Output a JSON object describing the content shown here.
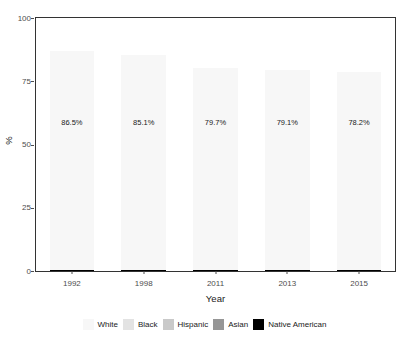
{
  "chart_data": {
    "type": "bar",
    "subtype": "stacked-percent",
    "title": "",
    "xlabel": "Year",
    "ylabel": "%",
    "categories": [
      "1992",
      "1998",
      "2011",
      "2013",
      "2015"
    ],
    "ylim": [
      0,
      100
    ],
    "yticks": [
      0,
      25,
      50,
      75,
      100
    ],
    "ytick_labels": [
      "0",
      "25",
      "50",
      "75",
      "100"
    ],
    "grid": false,
    "legend_position": "bottom",
    "stack_order_bottom_to_top": [
      "Asian",
      "Hispanic",
      "Black",
      "White"
    ],
    "series": [
      {
        "name": "White",
        "color": "#f7f7f7",
        "values": [
          86.5,
          85.1,
          79.7,
          79.1,
          78.2
        ],
        "labels": [
          "86.5%",
          "85.1%",
          "79.7%",
          "79.1%",
          "78.2%"
        ]
      },
      {
        "name": "Black",
        "color": "#e3e3e3",
        "values": [
          4.0,
          4.3,
          6.4,
          6.2,
          6.6
        ]
      },
      {
        "name": "Hispanic",
        "color": "#c9c9c9",
        "values": [
          2.6,
          3.0,
          3.8,
          4.1,
          4.4
        ]
      },
      {
        "name": "Asian",
        "color": "#969696",
        "values": [
          6.7,
          7.4,
          9.9,
          10.4,
          10.6
        ]
      },
      {
        "name": "Native American",
        "color": "#000000",
        "values": [
          0.2,
          0.2,
          0.2,
          0.2,
          0.2
        ]
      }
    ],
    "annotations": [
      {
        "category": "1992",
        "text": "86.5%",
        "y": 59
      },
      {
        "category": "1998",
        "text": "85.1%",
        "y": 59
      },
      {
        "category": "2011",
        "text": "79.7%",
        "y": 59
      },
      {
        "category": "2013",
        "text": "79.1%",
        "y": 59
      },
      {
        "category": "2015",
        "text": "78.2%",
        "y": 59
      }
    ]
  },
  "legend": {
    "items": [
      {
        "label": "White",
        "color": "#f7f7f7"
      },
      {
        "label": "Black",
        "color": "#e3e3e3"
      },
      {
        "label": "Hispanic",
        "color": "#c9c9c9"
      },
      {
        "label": "Asian",
        "color": "#969696"
      },
      {
        "label": "Native American",
        "color": "#000000"
      }
    ]
  },
  "axes": {
    "y_title": "%",
    "x_title": "Year"
  }
}
